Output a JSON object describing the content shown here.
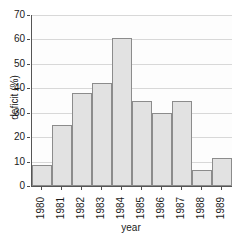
{
  "chart_data": {
    "type": "bar",
    "title": "",
    "xlabel": "year",
    "ylabel": "deficit (%)",
    "categories": [
      "1980",
      "1981",
      "1982",
      "1983",
      "1984",
      "1985",
      "1986",
      "1987",
      "1988",
      "1989"
    ],
    "values": [
      8.5,
      25,
      38,
      42,
      60.5,
      35,
      30,
      35,
      6.5,
      11.5
    ],
    "ylim": [
      0,
      70
    ],
    "yticks": [
      0,
      10,
      20,
      30,
      40,
      50,
      60,
      70
    ],
    "ytick_labels": [
      "0",
      "10",
      "20",
      "30",
      "40",
      "50",
      "60",
      "70"
    ],
    "grid": true,
    "legend": false,
    "colors": {
      "bar_fill": "#e2e2e2",
      "bar_border": "#8c8c8c",
      "gridline": "#d8d8d8",
      "axis": "#555555",
      "text": "#1a1a1a",
      "plot_background": "#fdfdfd",
      "page_background": "#ffffff"
    }
  }
}
